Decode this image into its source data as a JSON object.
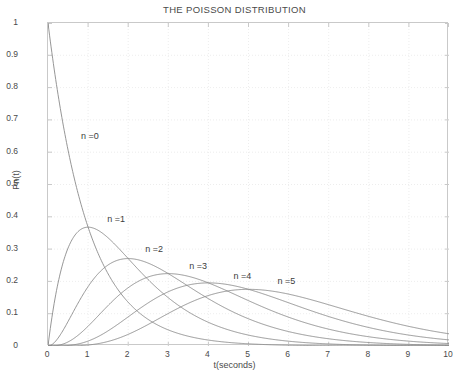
{
  "chart_data": {
    "type": "line",
    "title": "THE POISSON DISTRIBUTION",
    "xlabel": "t(seconds)",
    "ylabel": "Pn(t)",
    "xlim": [
      0,
      10
    ],
    "ylim": [
      0,
      1
    ],
    "grid": true,
    "grid_style": "dotted",
    "legend": "inline-annotations",
    "xticks": [
      "0",
      "1",
      "2",
      "3",
      "4",
      "5",
      "6",
      "7",
      "8",
      "9",
      "10"
    ],
    "xtick_values": [
      0,
      1,
      2,
      3,
      4,
      5,
      6,
      7,
      8,
      9,
      10
    ],
    "yticks": [
      "0",
      "0.1",
      "0.2",
      "0.3",
      "0.4",
      "0.5",
      "0.6",
      "0.7",
      "0.8",
      "0.9",
      "1"
    ],
    "ytick_values": [
      0,
      0.1,
      0.2,
      0.3,
      0.4,
      0.5,
      0.6,
      0.7,
      0.8,
      0.9,
      1
    ],
    "formula": "Pn(t) = (t^n * e^(-t)) / n!",
    "lambda": 1,
    "line_color": "#8a8a8a",
    "frame_color": "#c9c9c9",
    "grid_color": "#e8e8e8",
    "background_color": "#ffffff",
    "annotations": [
      {
        "text": "n =0",
        "x": 0.85,
        "y": 0.645
      },
      {
        "text": "n =1",
        "x": 1.5,
        "y": 0.388
      },
      {
        "text": "n =2",
        "x": 2.45,
        "y": 0.295
      },
      {
        "text": "n =3",
        "x": 3.55,
        "y": 0.243
      },
      {
        "text": "n =4",
        "x": 4.65,
        "y": 0.212
      },
      {
        "text": "n =5",
        "x": 5.75,
        "y": 0.196
      }
    ],
    "series": [
      {
        "name": "n =0",
        "n": 0,
        "x": [
          0,
          0.25,
          0.5,
          0.75,
          1,
          1.25,
          1.5,
          1.75,
          2,
          2.5,
          3,
          3.5,
          4,
          4.5,
          5,
          6,
          7,
          8,
          9,
          10
        ],
        "values": [
          1,
          0.7788,
          0.6065,
          0.4724,
          0.3679,
          0.2865,
          0.2231,
          0.1738,
          0.1353,
          0.0821,
          0.0498,
          0.0302,
          0.0183,
          0.0111,
          0.0067,
          0.0025,
          0.0009,
          0.0003,
          0.0001,
          0.0
        ]
      },
      {
        "name": "n =1",
        "n": 1,
        "x": [
          0,
          0.25,
          0.5,
          0.75,
          1,
          1.25,
          1.5,
          1.75,
          2,
          2.5,
          3,
          3.5,
          4,
          4.5,
          5,
          6,
          7,
          8,
          9,
          10
        ],
        "values": [
          0,
          0.1947,
          0.3033,
          0.3543,
          0.3679,
          0.3581,
          0.3347,
          0.3041,
          0.2707,
          0.2052,
          0.1494,
          0.1057,
          0.0733,
          0.05,
          0.0337,
          0.0149,
          0.0064,
          0.0027,
          0.0011,
          0.0005
        ]
      },
      {
        "name": "n =2",
        "n": 2,
        "x": [
          0,
          0.5,
          1,
          1.5,
          2,
          2.5,
          3,
          3.5,
          4,
          4.5,
          5,
          6,
          7,
          8,
          9,
          10
        ],
        "values": [
          0,
          0.0758,
          0.1839,
          0.251,
          0.2707,
          0.2565,
          0.224,
          0.185,
          0.1465,
          0.1125,
          0.0842,
          0.0446,
          0.0223,
          0.0107,
          0.005,
          0.0023
        ]
      },
      {
        "name": "n =3",
        "n": 3,
        "x": [
          0,
          0.5,
          1,
          1.5,
          2,
          2.5,
          3,
          3.5,
          4,
          4.5,
          5,
          6,
          7,
          8,
          9,
          10
        ],
        "values": [
          0,
          0.0126,
          0.0613,
          0.1255,
          0.1804,
          0.2138,
          0.224,
          0.2158,
          0.1954,
          0.1687,
          0.1404,
          0.0892,
          0.0521,
          0.0286,
          0.015,
          0.0076
        ]
      },
      {
        "name": "n =4",
        "n": 4,
        "x": [
          0,
          0.5,
          1,
          1.5,
          2,
          2.5,
          3,
          3.5,
          4,
          4.5,
          5,
          6,
          7,
          8,
          9,
          10
        ],
        "values": [
          0,
          0.0016,
          0.0153,
          0.0471,
          0.0902,
          0.1336,
          0.168,
          0.1888,
          0.1954,
          0.1898,
          0.1755,
          0.1339,
          0.0912,
          0.0573,
          0.0337,
          0.0189
        ]
      },
      {
        "name": "n =5",
        "n": 5,
        "x": [
          0,
          0.5,
          1,
          1.5,
          2,
          2.5,
          3,
          3.5,
          4,
          4.5,
          5,
          6,
          7,
          8,
          9,
          10
        ],
        "values": [
          0,
          0.0002,
          0.0031,
          0.0141,
          0.0361,
          0.0668,
          0.1008,
          0.1322,
          0.1563,
          0.1708,
          0.1755,
          0.1606,
          0.1277,
          0.0916,
          0.0607,
          0.0378
        ]
      }
    ]
  },
  "caption": ""
}
